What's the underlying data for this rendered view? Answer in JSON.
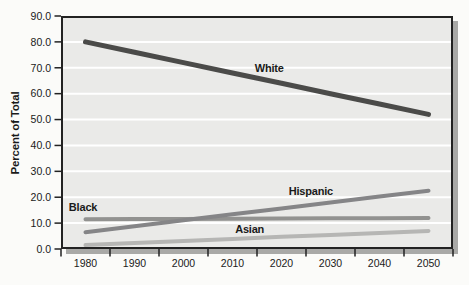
{
  "chart_data": {
    "type": "line",
    "title": "",
    "ylabel": "Percent of Total",
    "xlabel": "",
    "categories": [
      "1980",
      "1990",
      "2000",
      "2010",
      "2020",
      "2030",
      "2040",
      "2050"
    ],
    "y_tick_labels": [
      "90.0",
      "80.0",
      "70.0",
      "60.0",
      "50.0",
      "40.0",
      "30.0",
      "20.0",
      "10.0",
      "0.0"
    ],
    "ylim": [
      0,
      90
    ],
    "grid": {
      "horizontal": true,
      "vertical": false
    },
    "legend_position": "inline-labels-next-to-lines",
    "series": [
      {
        "name": "White",
        "values": [
          80,
          76,
          72,
          68,
          64,
          60,
          56,
          52
        ],
        "color": "#4b4b49",
        "label_year": 2017.5,
        "label_value": 70
      },
      {
        "name": "Black",
        "values": [
          11.5,
          11.6,
          11.6,
          11.7,
          11.8,
          11.9,
          11.9,
          12
        ],
        "color": "#929290",
        "label_year": 1979.5,
        "label_value": 16
      },
      {
        "name": "Hispanic",
        "values": [
          6.5,
          8.8,
          11.1,
          13.4,
          15.7,
          18,
          20.3,
          22.5
        ],
        "color": "#858587",
        "label_year": 2026,
        "label_value": 22.5
      },
      {
        "name": "Asian",
        "values": [
          1.5,
          2.3,
          3.1,
          3.9,
          4.7,
          5.4,
          6.2,
          7
        ],
        "color": "#b6b6b4",
        "label_year": 2013.5,
        "label_value": 7.7
      }
    ],
    "colors": {
      "plot_background": "#eaeae8",
      "gridline": "#ffffff",
      "frame": "#222222",
      "shadow": "#a9a9a7",
      "text": "#1a1a1a"
    }
  }
}
